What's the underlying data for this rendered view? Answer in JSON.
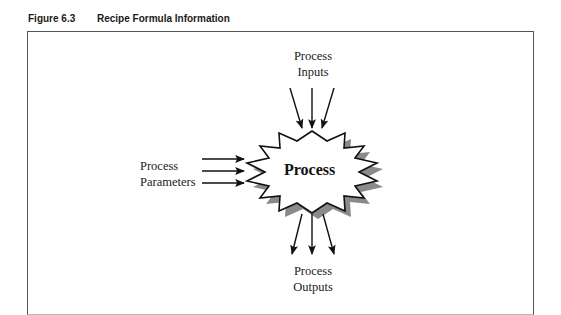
{
  "figure": {
    "number": "Figure 6.3",
    "title": "Recipe Formula Information"
  },
  "diagram": {
    "center_node": {
      "label": "Process",
      "shape": "starburst-icon"
    },
    "inputs": {
      "line1": "Process",
      "line2": "Inputs",
      "arrow_count": 3,
      "direction": "into center from top"
    },
    "parameters": {
      "line1": "Process",
      "line2": "Parameters",
      "arrow_count": 3,
      "direction": "into center from left"
    },
    "outputs": {
      "line1": "Process",
      "line2": "Outputs",
      "arrow_count": 3,
      "direction": "out of center downward"
    }
  },
  "colors": {
    "frame": "#555555",
    "shadow": "#808080",
    "stroke": "#111111",
    "fill": "#ffffff"
  }
}
